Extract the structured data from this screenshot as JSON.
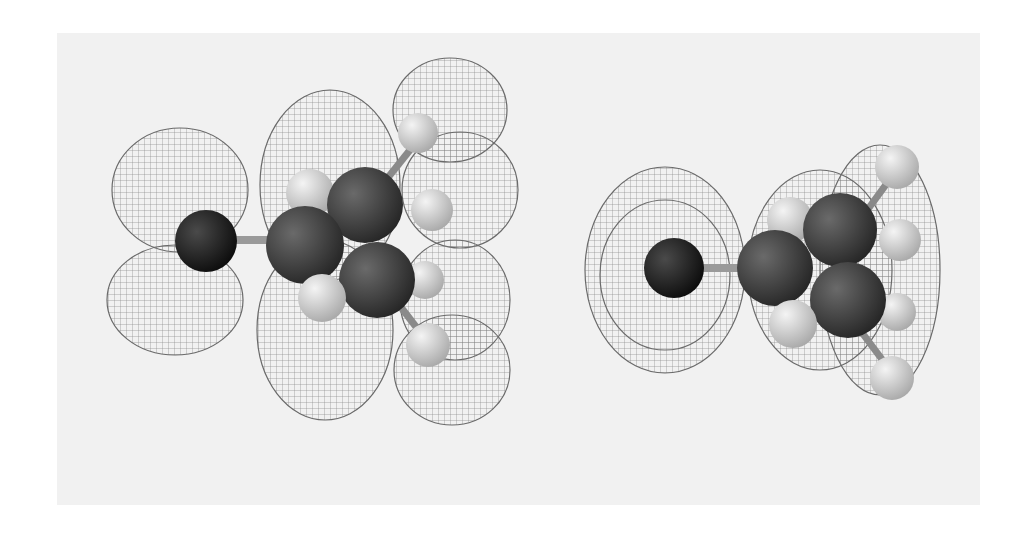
{
  "figure": {
    "background_color": "#f1f1f1",
    "page_color": "#ffffff",
    "panels": [
      {
        "id": "left",
        "description": "Molecular orbital isosurface (wireframe lobes) with ball-and-stick molecule, side view",
        "lobe_color": "#6a6a6a",
        "heavy_atom_color": "#1a1a1a",
        "carbon_color": "#3a3a3a",
        "hydrogen_color": "#d6d6d6"
      },
      {
        "id": "right",
        "description": "Molecular orbital isosurface (wireframe lobes) with ball-and-stick molecule, end-on view",
        "lobe_color": "#6a6a6a",
        "heavy_atom_color": "#1a1a1a",
        "carbon_color": "#3a3a3a",
        "hydrogen_color": "#d6d6d6"
      }
    ]
  }
}
